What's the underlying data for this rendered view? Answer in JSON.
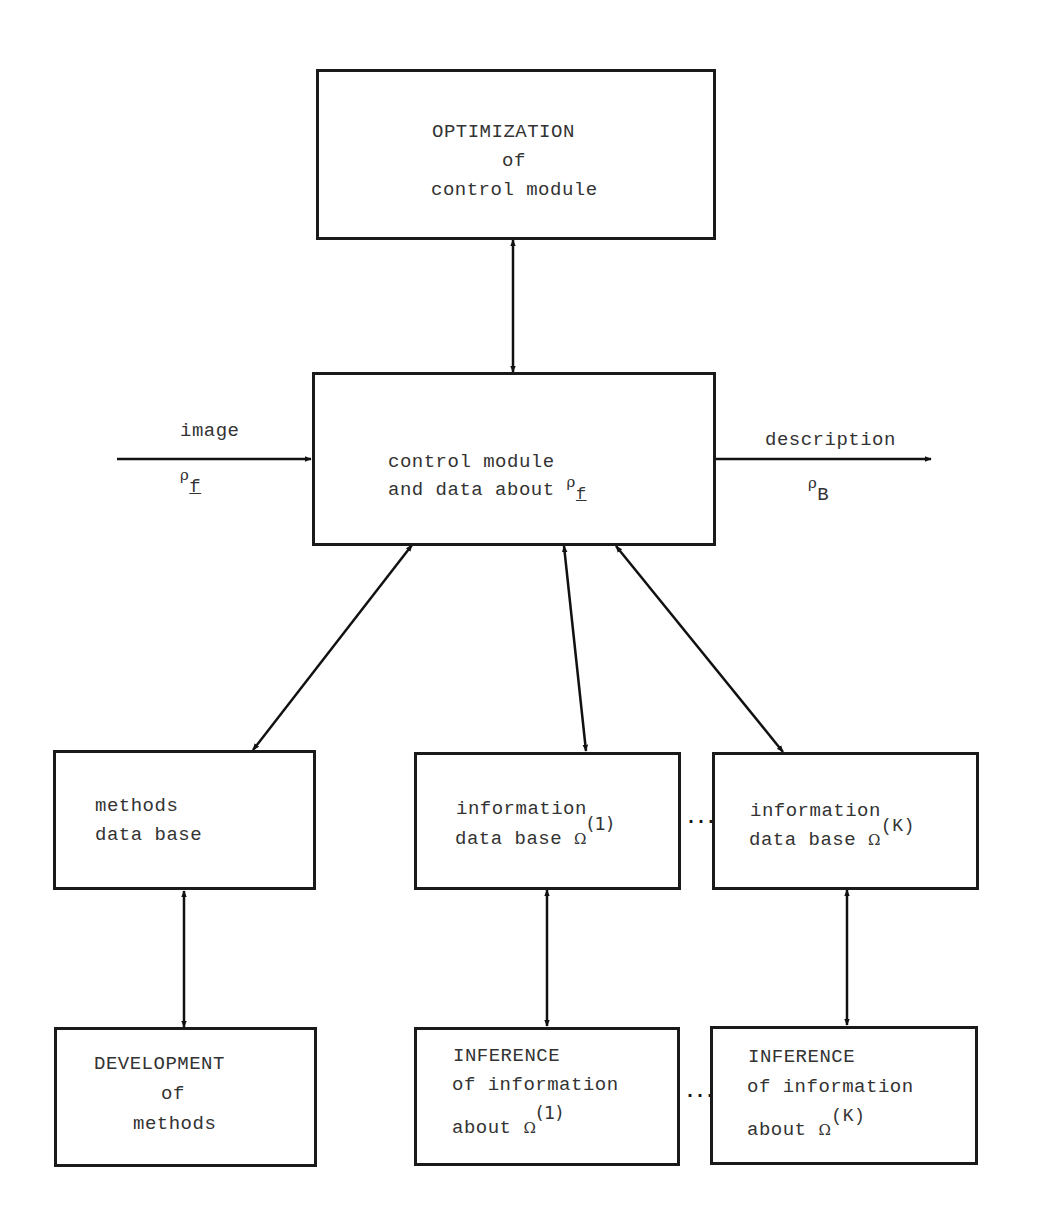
{
  "diagram": {
    "type": "block-diagram",
    "nodes": {
      "optimization": {
        "line1": "OPTIMIZATION",
        "line2": "of",
        "line3": "control module"
      },
      "control": {
        "line1": "control module",
        "line2": "and data about",
        "symbol": "ρ",
        "subscript": "f"
      },
      "methods_db": {
        "line1": "methods",
        "line2": "data base"
      },
      "info_db_1": {
        "line1": "information",
        "line2": "data base",
        "symbol": "Ω",
        "superscript": "(1)"
      },
      "info_db_k": {
        "line1": "information",
        "line2": "data base",
        "symbol": "Ω",
        "superscript": "(K)"
      },
      "development": {
        "line1": "DEVELOPMENT",
        "line2": "of",
        "line3": "methods"
      },
      "inference_1": {
        "line1": "INFERENCE",
        "line2": "of information",
        "line3": "about",
        "symbol": "Ω",
        "superscript": "(1)"
      },
      "inference_k": {
        "line1": "INFERENCE",
        "line2": "of information",
        "line3": "about",
        "symbol": "Ω",
        "superscript": "(K)"
      }
    },
    "input": {
      "label": "image",
      "symbol": "ρ",
      "subscript": "f"
    },
    "output": {
      "label": "description",
      "symbol": "ρ",
      "subscript": "B"
    },
    "ellipsis": "...",
    "edges": [
      {
        "from": "optimization",
        "to": "control",
        "direction": "bidirectional"
      },
      {
        "from": "input",
        "to": "control",
        "direction": "forward"
      },
      {
        "from": "control",
        "to": "output",
        "direction": "forward"
      },
      {
        "from": "control",
        "to": "methods_db",
        "direction": "bidirectional"
      },
      {
        "from": "control",
        "to": "info_db_1",
        "direction": "bidirectional"
      },
      {
        "from": "control",
        "to": "info_db_k",
        "direction": "bidirectional"
      },
      {
        "from": "methods_db",
        "to": "development",
        "direction": "bidirectional"
      },
      {
        "from": "info_db_1",
        "to": "inference_1",
        "direction": "bidirectional"
      },
      {
        "from": "info_db_k",
        "to": "inference_k",
        "direction": "bidirectional"
      }
    ]
  }
}
